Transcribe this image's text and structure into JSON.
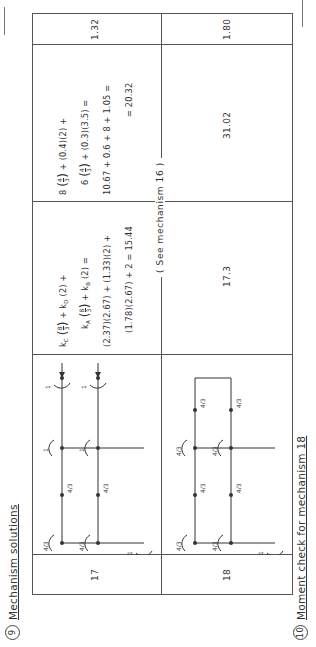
{
  "headings": {
    "section9": {
      "number": "9",
      "title": "Mechanism solutions"
    },
    "section10": {
      "number": "10",
      "title": "Moment check for mechanism 18"
    }
  },
  "table": {
    "rows": [
      {
        "mechanism": "17",
        "diagram_labels": {
          "joint_rotation": "4/3",
          "beam_mid": "4/3",
          "top_joint": "1",
          "moment": "1"
        },
        "equation_lines": [
          "k_C (8/3) + k_D (2) +",
          "k_A (8/3) + k_B (2) =",
          "(2.37)(2.67) + (1.33)(2) +",
          "(1.78)(2.67) + 2 = 15.44"
        ],
        "equation_result": "15.44",
        "work_lines": [
          "8 (4/3) + (0.4)(2) +",
          "6 (4/3) + (0.3)(3.5) =",
          "10.67 + 0.6 + 8 + 1.05 =",
          "= 20.32"
        ],
        "work_result": "20.32",
        "ratio": "1.32"
      },
      {
        "mechanism": "18",
        "diagram_labels": {
          "joint_rotation": "4/3",
          "beam_mid": "4/3",
          "moment": "1"
        },
        "equation_note": "( See mechanism 16 )",
        "internal_work": "17.3",
        "external_work": "31.02",
        "ratio": "1.80"
      }
    ]
  },
  "text": {
    "r17_eq1": "+ k",
    "r17_eq1_sub": "D",
    "r17_eq1_tail": "(2) +",
    "r17_eq1_head": "k",
    "r17_eq1_head_sub": "C",
    "r17_eq2_head": "k",
    "r17_eq2_head_sub": "A",
    "r17_eq2_mid": "+ k",
    "r17_eq2_mid_sub": "B",
    "r17_eq2_tail": "(2) =",
    "r17_eq3": "(2.37)(2.67) + (1.33)(2) +",
    "r17_eq4": "(1.78)(2.67) + 2 = 15.44",
    "r17_w1_head": "8",
    "r17_w1_tail": "+ (0.4)(2) +",
    "r17_w2_head": "6",
    "r17_w2_tail": "+ (0.3)(3.5) =",
    "r17_w3": "10.67 + 0.6 + 8 + 1.05 =",
    "r17_w4": "= 20.32",
    "r17_ratio": "1.32",
    "r17_num": "17",
    "r18_note": "( See mechanism 16 )",
    "r18_int": "17.3",
    "r18_ext": "31.02",
    "r18_ratio": "1.80",
    "r18_num": "18",
    "frac_8": "8",
    "frac_4": "4",
    "frac_3": "3",
    "one": "1",
    "four": "4",
    "three": "3"
  }
}
